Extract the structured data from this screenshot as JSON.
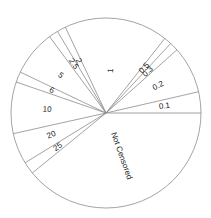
{
  "chart_data": {
    "type": "pie",
    "title": "",
    "start_angle_deg": 0,
    "direction": "counterclockwise",
    "legend": "none",
    "fill": "none (white slices, thin gray outlines)",
    "categories": [
      "0.1",
      "0.2",
      "0.3",
      "0.5",
      "1",
      "2",
      "2.5",
      "5",
      "6",
      "10",
      "20",
      "25",
      "Not Censored"
    ],
    "values": [
      3.6,
      8.0,
      1.5,
      1.3,
      17.7,
      1.5,
      1.6,
      7.8,
      1.8,
      8.8,
      5.3,
      2.1,
      39.2
    ],
    "units": "percent of whole (estimated from slice angles)"
  },
  "style": {
    "stroke_color": "#8c8c8c",
    "background": "#ffffff",
    "label_color": "#222222"
  },
  "geometry": {
    "cx": 106,
    "cy": 113,
    "r": 95
  }
}
